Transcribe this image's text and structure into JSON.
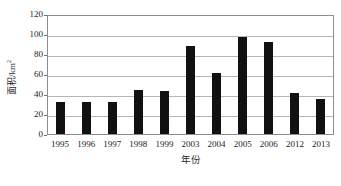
{
  "chart_data": {
    "type": "bar",
    "title": "",
    "xlabel": "年份",
    "ylabel": "面积/km",
    "ylabel_superscript": "2",
    "ylabel_full": "面积/km²",
    "categories": [
      "1995",
      "1996",
      "1997",
      "1998",
      "1999",
      "2003",
      "2004",
      "2005",
      "2006",
      "2012",
      "2013"
    ],
    "values": [
      32,
      32,
      32,
      44,
      43,
      88,
      61,
      97,
      92,
      41,
      35
    ],
    "ylim": [
      0,
      120
    ],
    "ytick_values": [
      "0",
      "20",
      "40",
      "60",
      "80",
      "100",
      "120"
    ],
    "ytick_numbers": [
      0,
      20,
      40,
      60,
      80,
      100,
      120
    ],
    "grid": "horizontal",
    "legend": "none",
    "bar_color": "#111111",
    "gridline_color": "#b5b5b5",
    "frame_color": "#8d8d8d",
    "background_color": "#ffffff"
  }
}
